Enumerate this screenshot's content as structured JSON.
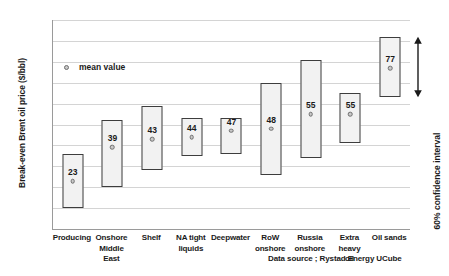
{
  "chart_data": {
    "type": "bar",
    "chart_style": "floating range bars with mean markers",
    "title": "",
    "xlabel": "",
    "ylabel": "Break-even Brent oil price ($/bbl)",
    "ylim": [
      0,
      100
    ],
    "ytick_step": 10,
    "yticks": [
      "100",
      "90",
      "80",
      "70",
      "60",
      "50",
      "40",
      "30",
      "20",
      "10",
      "0"
    ],
    "grid": true,
    "grid_axis": "y",
    "legend": {
      "position": "inside-upper-left",
      "entries": [
        {
          "label": "mean value",
          "marker": "circle",
          "fill": "#c9c9c9",
          "stroke": "#6e6e6e"
        }
      ]
    },
    "categories": [
      "Producing",
      "Onshore Middle East",
      "Shelf",
      "NA tight liquids",
      "Deepwater",
      "RoW onshore",
      "Russia onshore",
      "Extra heavy oil",
      "Oil sands"
    ],
    "category_lines": [
      [
        "Producing"
      ],
      [
        "Onshore",
        "Middle East"
      ],
      [
        "Shelf"
      ],
      [
        "NA tight",
        "liquids"
      ],
      [
        "Deepwater"
      ],
      [
        "RoW",
        "onshore"
      ],
      [
        "Russia",
        "onshore"
      ],
      [
        "Extra heavy",
        "oil"
      ],
      [
        "Oil sands"
      ]
    ],
    "series": [
      {
        "name": "range low",
        "values": [
          10,
          20,
          28,
          35,
          36,
          26,
          34,
          41,
          63
        ]
      },
      {
        "name": "range high",
        "values": [
          36,
          52,
          59,
          53,
          53,
          70,
          81,
          65,
          92
        ]
      },
      {
        "name": "mean value",
        "values": [
          23,
          39,
          43,
          44,
          47,
          48,
          55,
          55,
          77
        ]
      }
    ],
    "data_labels": [
      "23",
      "39",
      "43",
      "44",
      "47",
      "48",
      "55",
      "55",
      "77"
    ],
    "annotations": [
      {
        "name": "confidence-interval",
        "text": "60% confidence interval",
        "marker": "double-headed-vertical-arrow",
        "applies_to": "Oil sands",
        "span": [
          63,
          92
        ]
      }
    ],
    "source_note": "Data source ; Rystad Energy UCube",
    "colors": {
      "bar_fill": "#f2f2f2",
      "bar_stroke": "#3d3d3d",
      "mean_fill": "#c9c9c9",
      "mean_stroke": "#6e6e6e",
      "gridline": "#d4d4d4",
      "axis": "#9a9a9a",
      "text": "#1a1a1a",
      "background": "#ffffff"
    }
  }
}
